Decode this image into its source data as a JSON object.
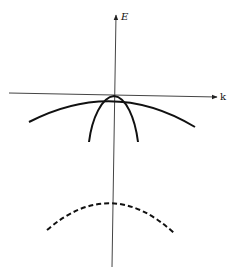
{
  "diagram": {
    "type": "band-structure",
    "axes": {
      "vertical_label": "E",
      "horizontal_label": "k"
    },
    "colors": {
      "axis": "#444444",
      "curve": "#111111",
      "background": "#ffffff"
    },
    "curves": [
      {
        "name": "light-hole-band",
        "style": "solid",
        "shape": "wide downward parabola through origin"
      },
      {
        "name": "heavy-hole-band",
        "style": "solid",
        "shape": "narrow downward parabola through origin"
      },
      {
        "name": "split-off-band",
        "style": "dashed",
        "shape": "downward parabola below origin"
      }
    ]
  }
}
